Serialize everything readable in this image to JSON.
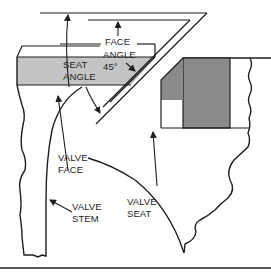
{
  "diagram": {
    "labels": {
      "face_angle": {
        "line1": "FACE",
        "line2": "ANGLE",
        "line3": "45°"
      },
      "seat_angle": {
        "line1": "SEAT",
        "line2": "ANGLE"
      },
      "valve_face": {
        "line1": "VALVE",
        "line2": "FACE"
      },
      "valve_stem": {
        "line1": "VALVE",
        "line2": "STEM"
      },
      "valve_seat": {
        "line1": "VALVE",
        "line2": "SEAT"
      }
    },
    "colors": {
      "line": "#1e1e1e",
      "valve_head_fill": "#c4c4c4",
      "seat_insert_fill": "#8a8a8a",
      "background": "#ffffff"
    }
  }
}
